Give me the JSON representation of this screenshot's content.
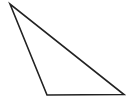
{
  "diagram": {
    "shape": "triangle",
    "stroke_color": "#222222",
    "fill_color": "none",
    "stroke_width": 1.6,
    "vertices": [
      {
        "x": 10,
        "y": 4
      },
      {
        "x": 47,
        "y": 95
      },
      {
        "x": 124,
        "y": 94.5
      }
    ]
  }
}
